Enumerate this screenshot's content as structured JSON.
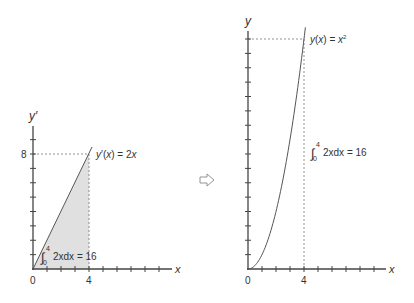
{
  "chart_data": [
    {
      "type": "area",
      "name": "derivative-chart",
      "function_label": "y′(x) = 2x",
      "function_label_parts": {
        "lhs": "y′(x) = 2",
        "var": "x"
      },
      "ylabel": "y′",
      "xlabel": "x",
      "x_tick_labels": [
        "0",
        "4"
      ],
      "y_tick_labels": [
        "8"
      ],
      "xlim": [
        0,
        10
      ],
      "ylim": [
        0,
        10
      ],
      "x": [
        0,
        4.2
      ],
      "y": [
        0,
        8.4
      ],
      "shaded_region": {
        "x_from": 0,
        "x_to": 4,
        "fill": "#e0e0e0"
      },
      "guide_lines": [
        {
          "type": "horizontal",
          "y": 8,
          "x_to": 4
        },
        {
          "type": "vertical",
          "x": 4,
          "y_to": 8
        }
      ],
      "annotation": {
        "integral_lower": "0",
        "integral_upper": "4",
        "integrand": "2xdx = 16"
      },
      "x_ticks_count": 9,
      "y_ticks_count": 9
    },
    {
      "type": "line",
      "name": "antiderivative-chart",
      "function_label": "y(x) = x²",
      "function_label_parts": {
        "lhs": "y(x) = x",
        "sup": "2"
      },
      "ylabel": "y",
      "xlabel": "x",
      "x_tick_labels": [
        "0",
        "4"
      ],
      "xlim": [
        0,
        10
      ],
      "ylim": [
        0,
        17
      ],
      "x": [
        0,
        0.5,
        1,
        1.5,
        2,
        2.5,
        3,
        3.5,
        4,
        4.1
      ],
      "y": [
        0,
        0.25,
        1,
        2.25,
        4,
        6.25,
        9,
        12.25,
        16,
        16.81
      ],
      "guide_lines": [
        {
          "type": "horizontal",
          "y": 16,
          "x_to": 4
        },
        {
          "type": "vertical",
          "x": 4,
          "y_to": 16
        }
      ],
      "annotation": {
        "integral_lower": "0",
        "integral_upper": "4",
        "integrand": "2xdx = 16"
      },
      "x_ticks_count": 9,
      "y_ticks_count": 16
    }
  ],
  "transition": {
    "icon": "right-arrow-icon"
  },
  "colors": {
    "axis": "#444444",
    "curve": "#555555",
    "guide": "#777777",
    "fill": "#e0e0e0",
    "text": "#333333"
  }
}
